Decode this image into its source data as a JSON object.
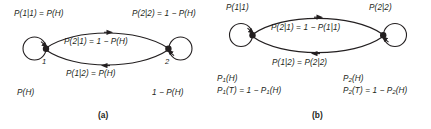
{
  "figure": {
    "type": "markov-chain-state-diagram",
    "background_color": "#ffffff",
    "ink_color": "#231f20",
    "panel_count": 2
  },
  "panel_a": {
    "caption": "(a)",
    "nodes": [
      {
        "id": "1",
        "label": "1",
        "self_loop_label": "P(1|1) = P(H)",
        "initial_label": "P(H)"
      },
      {
        "id": "2",
        "label": "2",
        "self_loop_label": "P(2|2) = 1 − P(H)",
        "initial_label": "1 − P(H)"
      }
    ],
    "edges": [
      {
        "from": "1",
        "to": "2",
        "arc": "top",
        "direction": "right",
        "label": "P(2|1) = 1 − P(H)"
      },
      {
        "from": "2",
        "to": "1",
        "arc": "bottom",
        "direction": "left",
        "label": "P(1|2) = P(H)"
      }
    ]
  },
  "panel_b": {
    "caption": "(b)",
    "nodes": [
      {
        "id": "1",
        "label": "",
        "self_loop_label": "P(1|1)",
        "initial_label_line1": "P",
        "initial_label_line1_sub": "1",
        "initial_label_line1_rest": "(H)",
        "initial_label_line2_rest": "(T) = 1 − P",
        "initial_label_line2_tail": "(H)"
      },
      {
        "id": "2",
        "label": "",
        "self_loop_label": "P(2|2)",
        "initial_label_line1": "P",
        "initial_label_line1_sub": "2",
        "initial_label_line1_rest": "(H)",
        "initial_label_line2_rest": "(T) = 1 − P",
        "initial_label_line2_tail": "(H)"
      }
    ],
    "edges": [
      {
        "from": "1",
        "to": "2",
        "arc": "top",
        "direction": "right",
        "label": "P(2|1) = 1 − P(1|1)"
      },
      {
        "from": "2",
        "to": "1",
        "arc": "bottom",
        "direction": "left",
        "label": "P(1|2) = P(2|2)"
      }
    ]
  },
  "labels": {
    "a_self1": "P(1|1) = P(H)",
    "a_self2": "P(2|2) = 1 − P(H)",
    "a_top_edge": "P(2|1) = 1 − P(H)",
    "a_bottom_edge": "P(1|2) = P(H)",
    "a_init1": "P(H)",
    "a_init2": "1 − P(H)",
    "a_node1_num": "1",
    "a_node2_num": "2",
    "caption_a": "(a)",
    "b_self1": "P(1|1)",
    "b_self2": "P(2|2)",
    "b_top_edge": "P(2|1) = 1 − P(1|1)",
    "b_bottom_edge": "P(1|2) = P(2|2)",
    "b_init1_l1_pre": "P",
    "b_init1_l1_sub": "1",
    "b_init1_l1_post": "(H)",
    "b_init1_l2_pre": "P",
    "b_init1_l2_sub": "1",
    "b_init1_l2_mid": "(T) = 1 − P",
    "b_init1_l2_sub2": "1",
    "b_init1_l2_post": "(H)",
    "b_init2_l1_pre": "P",
    "b_init2_l1_sub": "2",
    "b_init2_l1_post": "(H)",
    "b_init2_l2_pre": "P",
    "b_init2_l2_sub": "2",
    "b_init2_l2_mid": "(T) = 1 − P",
    "b_init2_l2_sub2": "2",
    "b_init2_l2_post": "(H)",
    "caption_b": "(b)"
  }
}
